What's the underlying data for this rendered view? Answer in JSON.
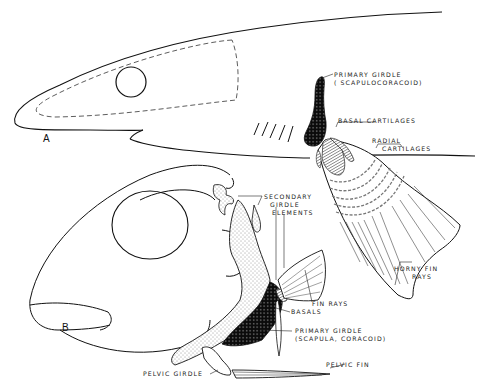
{
  "figure": {
    "panels": [
      {
        "id": "A",
        "label": "A",
        "subject": "shark body outline with pectoral girdle and fin"
      },
      {
        "id": "B",
        "label": "B",
        "subject": "bony fish head with pectoral and pelvic girdles"
      }
    ],
    "labels": {
      "primary_girdle_a_line1": "PRIMARY GIRDLE",
      "primary_girdle_a_line2": "( SCAPULOCORACOID)",
      "basal_cartilages": "BASAL CARTILAGES",
      "radial_cartilages_line1": "RADIAL",
      "radial_cartilages_line2": "CARTILAGES",
      "horny_fin_rays_line1": "HORNY FIN",
      "horny_fin_rays_line2": "RAYS",
      "secondary_girdle_line1": "SECONDARY",
      "secondary_girdle_line2": "GIRDLE",
      "secondary_girdle_line3": "ELEMENTS",
      "fin_rays": "FIN RAYS",
      "basals": "BASALS",
      "primary_girdle_b_line1": "PRIMARY GIRDLE",
      "primary_girdle_b_line2": "(SCAPULA, CORACOID)",
      "pelvic_fin": "PELVIC FIN",
      "pelvic_girdle": "PELVIC GIRDLE"
    },
    "colors": {
      "ink": "#111111",
      "hatch": "#777777",
      "background": "#ffffff"
    }
  }
}
